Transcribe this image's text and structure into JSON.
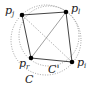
{
  "diagram": {
    "type": "geometry",
    "points": [
      {
        "id": "pj",
        "label": "p",
        "sub": "j",
        "x": 22,
        "y": 15,
        "lx": 5,
        "ly": 14
      },
      {
        "id": "pl",
        "label": "p",
        "sub": "l",
        "x": 66,
        "y": 12,
        "lx": 71,
        "ly": 12
      },
      {
        "id": "pr",
        "label": "p",
        "sub": "r",
        "x": 31,
        "y": 58,
        "lx": 19,
        "ly": 67
      },
      {
        "id": "pi",
        "label": "p",
        "sub": "i",
        "x": 72,
        "y": 62,
        "lx": 77,
        "ly": 66
      }
    ],
    "edges": [
      {
        "from": "pj",
        "to": "pl",
        "style": "solid"
      },
      {
        "from": "pl",
        "to": "pi",
        "style": "solid"
      },
      {
        "from": "pi",
        "to": "pr",
        "style": "solid"
      },
      {
        "from": "pr",
        "to": "pj",
        "style": "solid"
      },
      {
        "from": "pl",
        "to": "pr",
        "style": "solid-thin"
      },
      {
        "from": "pj",
        "to": "pi",
        "style": "dotted"
      }
    ],
    "circles": [
      {
        "id": "C",
        "label": "C",
        "cx": 46,
        "cy": 40,
        "r": 35,
        "lx": 25,
        "ly": 83
      },
      {
        "id": "Cprime",
        "label": "C'",
        "cx": 49,
        "cy": 36,
        "r": 30,
        "lx": 48,
        "ly": 73
      }
    ],
    "colors": {
      "stroke": "#444444",
      "dotted": "#888888",
      "point": "#000000"
    }
  }
}
